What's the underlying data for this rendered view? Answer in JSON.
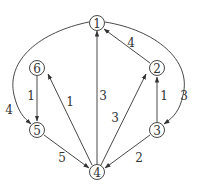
{
  "graph": {
    "type": "directed-weighted",
    "nodes": [
      {
        "id": "1",
        "label": "1",
        "x": 97,
        "y": 23
      },
      {
        "id": "2",
        "label": "2",
        "x": 157,
        "y": 68
      },
      {
        "id": "3",
        "label": "3",
        "x": 157,
        "y": 130
      },
      {
        "id": "4",
        "label": "4",
        "x": 97,
        "y": 172
      },
      {
        "id": "5",
        "label": "5",
        "x": 37,
        "y": 130
      },
      {
        "id": "6",
        "label": "6",
        "x": 37,
        "y": 68
      }
    ],
    "edges": [
      {
        "from": "1",
        "to": "5",
        "weight": "4"
      },
      {
        "from": "1",
        "to": "3",
        "weight": "3"
      },
      {
        "from": "2",
        "to": "1",
        "weight": "4"
      },
      {
        "from": "4",
        "to": "1",
        "weight": "3"
      },
      {
        "from": "4",
        "to": "2",
        "weight": "3"
      },
      {
        "from": "3",
        "to": "2",
        "weight": "1"
      },
      {
        "from": "6",
        "to": "5",
        "weight": "1"
      },
      {
        "from": "4",
        "to": "6",
        "weight": "1"
      },
      {
        "from": "5",
        "to": "4",
        "weight": "5"
      },
      {
        "from": "3",
        "to": "4",
        "weight": "2"
      }
    ]
  }
}
